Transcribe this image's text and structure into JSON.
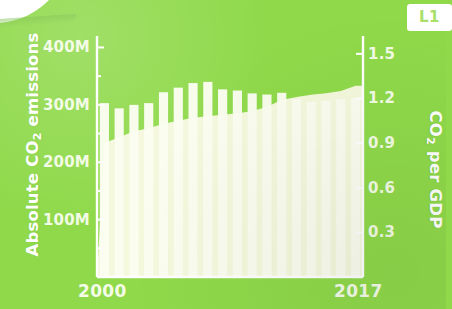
{
  "badge": {
    "label": "L1"
  },
  "axes": {
    "left_title": "Absolute CO",
    "left_title_sub": "2",
    "left_title_tail": " emissions",
    "right_title": "CO",
    "right_title_sub": "2",
    "right_title_tail": " per GDP",
    "x_start": "2000",
    "x_end": "2017"
  },
  "colors": {
    "background": "#8fd94a",
    "bar": "#fbfdf0",
    "area": "#f4f8dc",
    "axis": "#ffffff",
    "tick_text": "#f2fbe4",
    "badge_bg": "#ffffff",
    "badge_text": "#a8e06a"
  },
  "chart_data": {
    "type": "bar",
    "title": "",
    "xlabel": "",
    "ylabel": "Absolute CO2 emissions",
    "y2label": "CO2 per GDP",
    "grid": false,
    "legend": "none",
    "categories": [
      "2000",
      "2001",
      "2002",
      "2003",
      "2004",
      "2005",
      "2006",
      "2007",
      "2008",
      "2009",
      "2010",
      "2011",
      "2012",
      "2013",
      "2014",
      "2015",
      "2016",
      "2017"
    ],
    "left_axis": {
      "ticks": [
        "100M",
        "200M",
        "300M",
        "400M"
      ],
      "tick_values": [
        100,
        200,
        300,
        400
      ],
      "ylim": [
        0,
        420
      ],
      "unit": "M tonnes"
    },
    "right_axis": {
      "ticks": [
        "0.3",
        "0.6",
        "0.9",
        "1.2",
        "1.5"
      ],
      "tick_values": [
        0.3,
        0.6,
        0.9,
        1.2,
        1.5
      ],
      "ylim": [
        0,
        1.62
      ]
    },
    "series": [
      {
        "name": "Absolute CO2 emissions",
        "type": "bar",
        "axis": "left",
        "values": [
          303,
          294,
          300,
          303,
          322,
          330,
          338,
          340,
          327,
          325,
          320,
          318,
          321,
          310,
          305,
          307,
          310,
          312
        ]
      },
      {
        "name": "CO2 per GDP",
        "type": "area",
        "axis": "right",
        "values": [
          0.9,
          0.94,
          0.98,
          1.0,
          1.03,
          1.05,
          1.07,
          1.08,
          1.09,
          1.1,
          1.115,
          1.145,
          1.19,
          1.21,
          1.225,
          1.235,
          1.25,
          1.285
        ]
      }
    ]
  }
}
